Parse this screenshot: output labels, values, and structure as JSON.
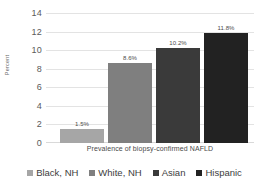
{
  "chart_data": {
    "type": "bar",
    "title": "",
    "subtitle": "",
    "xlabel": "Prevalence of biopsy-confirmed NAFLD",
    "ylabel": "Percent",
    "categories": [
      "Black, NH",
      "White, NH",
      "Asian",
      "Hispanic"
    ],
    "values": [
      1.5,
      8.6,
      10.2,
      11.8
    ],
    "data_labels": [
      "1.5%",
      "8.6%",
      "10.2%",
      "11.8%"
    ],
    "series": [
      {
        "name": "Prevalence of biopsy-confirmed NAFLD",
        "values": [
          1.5,
          8.6,
          10.2,
          11.8
        ]
      }
    ],
    "colors": [
      "#a6a6a6",
      "#7f7f7f",
      "#3a3a3a",
      "#222222"
    ],
    "ylim": [
      0,
      14
    ],
    "yticks": [
      0,
      2,
      4,
      6,
      8,
      10,
      12,
      14
    ],
    "ytick_labels": [
      "0",
      "2",
      "4",
      "6",
      "8",
      "10",
      "12",
      "14"
    ],
    "grid": true,
    "grid_axis": "y",
    "legend_position": "bottom"
  },
  "legend": {
    "items": [
      {
        "label": "Black, NH",
        "color": "#a6a6a6"
      },
      {
        "label": "White, NH",
        "color": "#7f7f7f"
      },
      {
        "label": "Asian",
        "color": "#3a3a3a"
      },
      {
        "label": "Hispanic",
        "color": "#222222"
      }
    ]
  }
}
